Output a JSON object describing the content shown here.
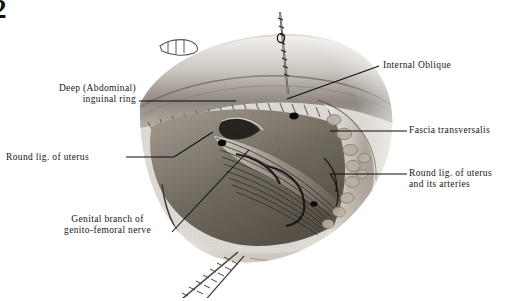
{
  "page": {
    "number": "2",
    "background_color": "#ffffff",
    "ink_color": "#151515"
  },
  "figure": {
    "name": "inguinal-region-dissection",
    "media": "halftone pencil/wash illustration"
  },
  "labels": [
    {
      "id": "deep-inguinal-ring",
      "lines": [
        "Deep (Abdominal)",
        "inguinal ring"
      ],
      "text": "Deep (Abdominal)\ninguinal ring",
      "side": "left",
      "leader": "horizontal"
    },
    {
      "id": "round-lig-uterus",
      "lines": [
        "Round lig. of uterus"
      ],
      "text": "Round lig. of uterus",
      "side": "left",
      "leader": "horizontal-then-diagonal"
    },
    {
      "id": "genital-branch",
      "lines": [
        "Genital branch of",
        "genito-femoral nerve"
      ],
      "text": "Genital branch of\ngenito-femoral nerve",
      "side": "left",
      "leader": "diagonal"
    },
    {
      "id": "internal-oblique",
      "lines": [
        "Internal Oblique"
      ],
      "text": "Internal Oblique",
      "side": "right",
      "leader": "diagonal"
    },
    {
      "id": "fascia-transversalis",
      "lines": [
        "Fascia transversalis"
      ],
      "text": "Fascia transversalis",
      "side": "right",
      "leader": "horizontal"
    },
    {
      "id": "round-lig-uterus-arteries",
      "lines": [
        "Round lig. of uterus",
        "and its arteries"
      ],
      "text": "Round lig. of uterus\nand its arteries",
      "side": "right",
      "leader": "horizontal"
    }
  ]
}
